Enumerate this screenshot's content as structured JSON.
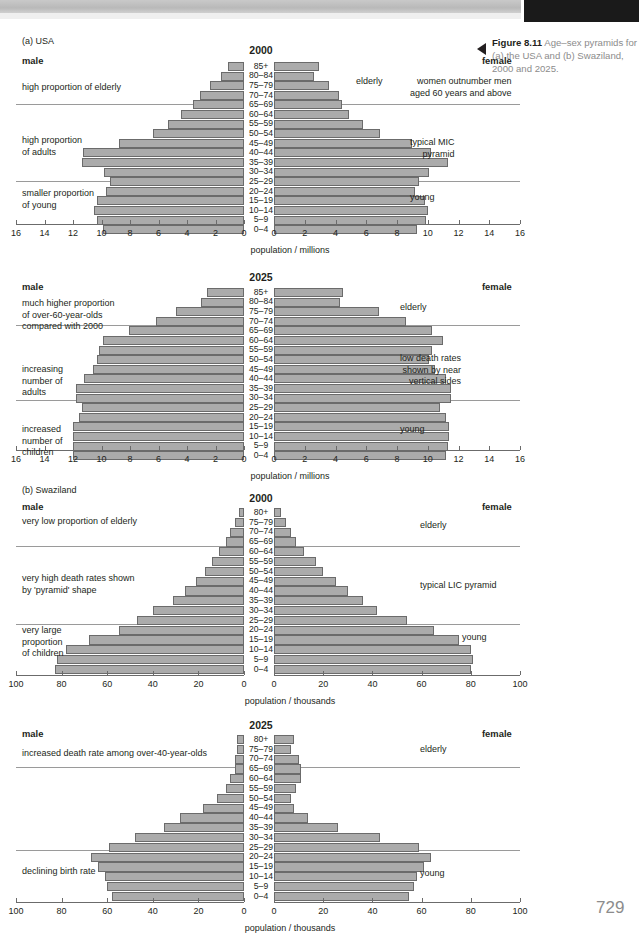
{
  "page": {
    "number": "729",
    "figure_number": "Figure 8.11",
    "figure_caption": "Age–sex pyramids for (a) the USA and (b) Swaziland, 2000 and 2025."
  },
  "sections": {
    "a_label": "(a) USA",
    "b_label": "(b) Swaziland"
  },
  "labels": {
    "male": "male",
    "female": "female",
    "axis_millions": "population / millions",
    "axis_thousands": "population / thousands",
    "elderly": "elderly",
    "young": "young"
  },
  "chart_data": [
    {
      "type": "bar",
      "id": "usa-2000",
      "title": "2000",
      "region": "USA",
      "xlabel": "population / millions",
      "unit": "millions",
      "xlim": [
        0,
        16
      ],
      "xticks": [
        0,
        2,
        4,
        6,
        8,
        10,
        12,
        14,
        16
      ],
      "grid": false,
      "categories": [
        "85+",
        "80–84",
        "75–79",
        "70–74",
        "65–69",
        "60–64",
        "55–59",
        "50–54",
        "45–49",
        "40–44",
        "35–39",
        "30–34",
        "25–29",
        "20–24",
        "15–19",
        "10–14",
        "5–9",
        "0–4"
      ],
      "series": [
        {
          "name": "male",
          "values": [
            1.1,
            1.6,
            2.4,
            3.1,
            3.6,
            4.4,
            5.3,
            6.4,
            8.8,
            11.3,
            11.4,
            9.8,
            9.4,
            9.7,
            10.3,
            10.5,
            10.3,
            9.9
          ]
        },
        {
          "name": "female",
          "values": [
            2.9,
            2.6,
            3.6,
            4.2,
            4.4,
            4.9,
            5.8,
            6.9,
            9.0,
            10.2,
            11.3,
            10.1,
            9.4,
            9.2,
            9.8,
            10.0,
            9.9,
            9.3
          ]
        }
      ],
      "annotations_left": [
        {
          "text": "high proportion of elderly"
        },
        {
          "text": "high proportion\nof adults"
        },
        {
          "text": "smaller proportion\nof young"
        }
      ],
      "annotations_right": [
        {
          "text": "elderly"
        },
        {
          "text": "women outnumber men\naged 60 years and above"
        },
        {
          "text": "typical MIC\npyramid"
        },
        {
          "text": "young"
        }
      ]
    },
    {
      "type": "bar",
      "id": "usa-2025",
      "title": "2025",
      "region": "USA",
      "xlabel": "population / millions",
      "unit": "millions",
      "xlim": [
        0,
        16
      ],
      "xticks": [
        0,
        2,
        4,
        6,
        8,
        10,
        12,
        14,
        16
      ],
      "grid": false,
      "categories": [
        "85+",
        "80–84",
        "75–79",
        "70–74",
        "65–69",
        "60–64",
        "55–59",
        "50–54",
        "45–49",
        "40–44",
        "35–39",
        "30–34",
        "25–29",
        "20–24",
        "15–19",
        "10–14",
        "5–9",
        "0–4"
      ],
      "series": [
        {
          "name": "male",
          "values": [
            2.6,
            3.0,
            4.8,
            6.2,
            8.1,
            9.9,
            10.2,
            10.3,
            10.6,
            11.2,
            11.8,
            11.8,
            11.4,
            11.6,
            12.0,
            12.0,
            12.0,
            12.0
          ]
        },
        {
          "name": "female",
          "values": [
            4.5,
            4.3,
            6.8,
            8.6,
            10.3,
            11.0,
            10.3,
            10.1,
            10.5,
            11.2,
            11.5,
            11.5,
            10.8,
            11.2,
            11.4,
            11.4,
            11.3,
            11.2
          ]
        }
      ],
      "annotations_left": [
        {
          "text": "much higher proportion\nof over-60-year-olds\ncompared with 2000"
        },
        {
          "text": "increasing\nnumber of\nadults"
        },
        {
          "text": "increased\nnumber of\nchildren"
        }
      ],
      "annotations_right": [
        {
          "text": "elderly"
        },
        {
          "text": "low death rates\nshown by near\nvertical sides"
        },
        {
          "text": "young"
        }
      ]
    },
    {
      "type": "bar",
      "id": "swaziland-2000",
      "title": "2000",
      "region": "Swaziland",
      "xlabel": "population / thousands",
      "unit": "thousands",
      "xlim": [
        0,
        100
      ],
      "xticks": [
        0,
        20,
        40,
        60,
        80,
        100
      ],
      "grid": false,
      "categories": [
        "80+",
        "75–79",
        "70–74",
        "65–69",
        "60–64",
        "55–59",
        "50–54",
        "45–49",
        "40–44",
        "35–39",
        "30–34",
        "25–29",
        "20–24",
        "15–19",
        "10–14",
        "5–9",
        "0–4"
      ],
      "series": [
        {
          "name": "male",
          "values": [
            2,
            4,
            6,
            8,
            11,
            14,
            17,
            21,
            26,
            31,
            40,
            47,
            55,
            68,
            78,
            82,
            83
          ]
        },
        {
          "name": "female",
          "values": [
            3,
            5,
            7,
            9,
            12,
            17,
            20,
            25,
            30,
            36,
            42,
            54,
            65,
            75,
            80,
            81,
            80
          ]
        }
      ],
      "annotations_left": [
        {
          "text": "very low proportion of elderly"
        },
        {
          "text": "very high death rates shown\nby 'pyramid' shape"
        },
        {
          "text": "very large\nproportion\nof children"
        }
      ],
      "annotations_right": [
        {
          "text": "elderly"
        },
        {
          "text": "typical LIC pyramid"
        },
        {
          "text": "young"
        }
      ]
    },
    {
      "type": "bar",
      "id": "swaziland-2025",
      "title": "2025",
      "region": "Swaziland",
      "xlabel": "population / thousands",
      "unit": "thousands",
      "xlim": [
        0,
        100
      ],
      "xticks": [
        0,
        20,
        40,
        60,
        80,
        100
      ],
      "grid": false,
      "categories": [
        "80+",
        "75–79",
        "70–74",
        "65–69",
        "60–64",
        "55–59",
        "50–54",
        "45–49",
        "40–44",
        "35–39",
        "30–34",
        "25–29",
        "20–24",
        "15–19",
        "10–14",
        "5–9",
        "0–4"
      ],
      "series": [
        {
          "name": "male",
          "values": [
            3,
            3,
            4,
            4,
            6,
            8,
            12,
            18,
            28,
            35,
            48,
            59,
            67,
            64,
            61,
            60,
            58
          ]
        },
        {
          "name": "female",
          "values": [
            8,
            7,
            10,
            11,
            11,
            9,
            7,
            8,
            14,
            26,
            43,
            59,
            64,
            61,
            58,
            57,
            55
          ]
        }
      ],
      "annotations_left": [
        {
          "text": "increased death rate among over-40-year-olds"
        },
        {
          "text": "declining birth rate"
        }
      ],
      "annotations_right": [
        {
          "text": "elderly"
        },
        {
          "text": "young"
        }
      ]
    }
  ]
}
